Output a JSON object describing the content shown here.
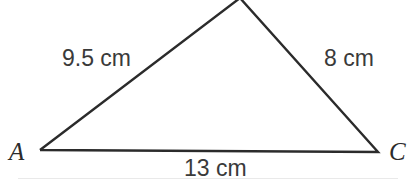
{
  "figure": {
    "background_color": "#ffffff",
    "line_color": "#2b2b2b",
    "text_color": "#3a3a3a"
  },
  "vertices": {
    "a": {
      "label": "A",
      "x": 40,
      "y": 150
    },
    "b": {
      "label": "",
      "x": 240,
      "y": 0
    },
    "c": {
      "label": "C",
      "x": 378,
      "y": 152
    }
  },
  "sides": {
    "ab": {
      "label": "9.5 cm",
      "value": 9.5,
      "unit": "cm"
    },
    "bc": {
      "label": "8 cm",
      "value": 8,
      "unit": "cm"
    },
    "ac": {
      "label": "13 cm",
      "value": 13,
      "unit": "cm"
    }
  }
}
